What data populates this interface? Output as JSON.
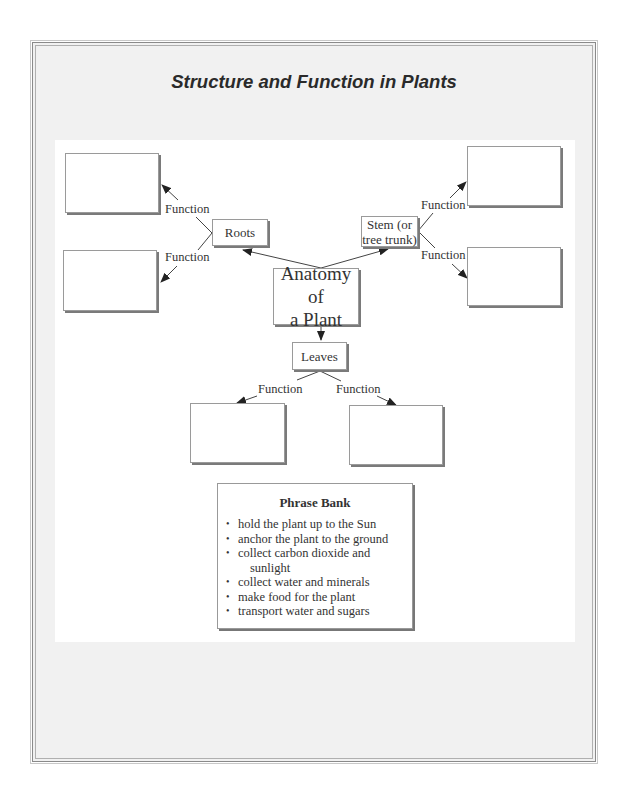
{
  "title": "Structure and Function in Plants",
  "diagram": {
    "center": {
      "line1": "Anatomy of",
      "line2": "a Plant"
    },
    "nodes": {
      "roots": "Roots",
      "stem": {
        "line1": "Stem (or",
        "line2": "tree trunk)"
      },
      "leaves": "Leaves"
    },
    "function_label": "Function",
    "answer_boxes": [
      {
        "id": "roots-function-1",
        "value": ""
      },
      {
        "id": "roots-function-2",
        "value": ""
      },
      {
        "id": "stem-function-1",
        "value": ""
      },
      {
        "id": "stem-function-2",
        "value": ""
      },
      {
        "id": "leaves-function-1",
        "value": ""
      },
      {
        "id": "leaves-function-2",
        "value": ""
      }
    ]
  },
  "phrase_bank": {
    "title": "Phrase Bank",
    "items": [
      "hold the plant up to the Sun",
      "anchor the plant to the ground",
      "collect carbon dioxide and",
      "collect water and minerals",
      "make food for the plant",
      "transport water and sugars"
    ],
    "item_3_continuation": "sunlight"
  }
}
